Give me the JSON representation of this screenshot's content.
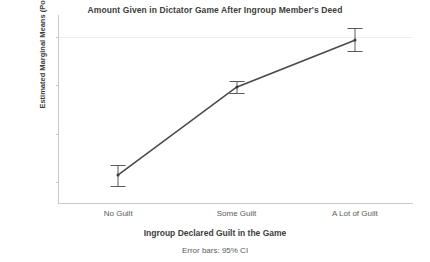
{
  "chart_data": {
    "type": "line",
    "title": "Amount Given in Dictator Game After Ingroup Member's Deed",
    "xlabel": "Ingroup Declared Guilt in the Game",
    "ylabel": "Estimated Marginal Means (Points)",
    "footnote": "Error bars: 95% CI",
    "categories": [
      "No Guilt",
      "Some Guilt",
      "A Lot of Guilt"
    ],
    "values": [
      0.0115,
      0.0296,
      0.0393
    ],
    "error_low": [
      0.009,
      0.0283,
      0.0368
    ],
    "error_high": [
      0.0135,
      0.0308,
      0.0418
    ],
    "ytick_labels": [
      ".04",
      ".03",
      ".02",
      ".01"
    ],
    "ytick_values": [
      0.04,
      0.03,
      0.02,
      0.01
    ],
    "ylim": [
      0.0055,
      0.0445
    ],
    "grid": "horizontal-faint",
    "legend": "none",
    "line_color": "#4a4a4a",
    "marker_color": "#3a3a3a",
    "error_color": "#5b5b5b",
    "grid_color": "#f0eff0",
    "axis_color": "#c9c9c9",
    "background": "#ffffff"
  }
}
